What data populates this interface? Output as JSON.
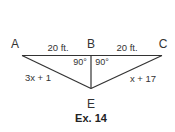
{
  "figure": {
    "caption": "Ex. 14",
    "points": {
      "A": {
        "label": "A",
        "x": 15,
        "y": 44
      },
      "B": {
        "label": "B",
        "x": 91,
        "y": 44
      },
      "C": {
        "label": "C",
        "x": 163,
        "y": 44
      },
      "E": {
        "label": "E",
        "x": 91,
        "y": 105
      }
    },
    "segments": [
      {
        "from": "A",
        "to": "B",
        "label": "20 ft."
      },
      {
        "from": "B",
        "to": "C",
        "label": "20 ft."
      },
      {
        "from": "A",
        "to": "E",
        "label": "3x + 1"
      },
      {
        "from": "C",
        "to": "E",
        "label": "x + 17"
      },
      {
        "from": "B",
        "to": "E",
        "label": ""
      }
    ],
    "angles": [
      {
        "at": "B",
        "side": "left",
        "label": "90°"
      },
      {
        "at": "B",
        "side": "right",
        "label": "90°"
      }
    ],
    "line_color": "#333333"
  }
}
